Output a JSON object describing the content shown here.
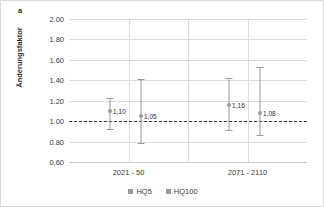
{
  "panel_label": "a",
  "chart_data": {
    "type": "scatter",
    "title": "",
    "xlabel": "",
    "ylabel": "Änderungsfaktor",
    "categories": [
      "2021 - 50",
      "2071 - 2110"
    ],
    "ylim": [
      0.6,
      2.0
    ],
    "yticks": [
      "0.60",
      "0.80",
      "1.00",
      "1.20",
      "1.40",
      "1.60",
      "1.80",
      "2.00"
    ],
    "ytick_values": [
      0.6,
      0.8,
      1.0,
      1.2,
      1.4,
      1.6,
      1.8,
      2.0
    ],
    "grid": true,
    "reference_line": 1.0,
    "legend_position": "bottom",
    "series": [
      {
        "name": "HQ5",
        "values": [
          1.1,
          1.16
        ],
        "labels": [
          "1,10",
          "1,16"
        ],
        "error_low": [
          0.92,
          0.91
        ],
        "error_high": [
          1.23,
          1.42
        ],
        "color": "#9a9a9a"
      },
      {
        "name": "HQ100",
        "values": [
          1.05,
          1.08
        ],
        "labels": [
          "1,05",
          "1,08"
        ],
        "error_low": [
          0.79,
          0.86
        ],
        "error_high": [
          1.41,
          1.53
        ],
        "color": "#9a9a9a"
      }
    ]
  }
}
